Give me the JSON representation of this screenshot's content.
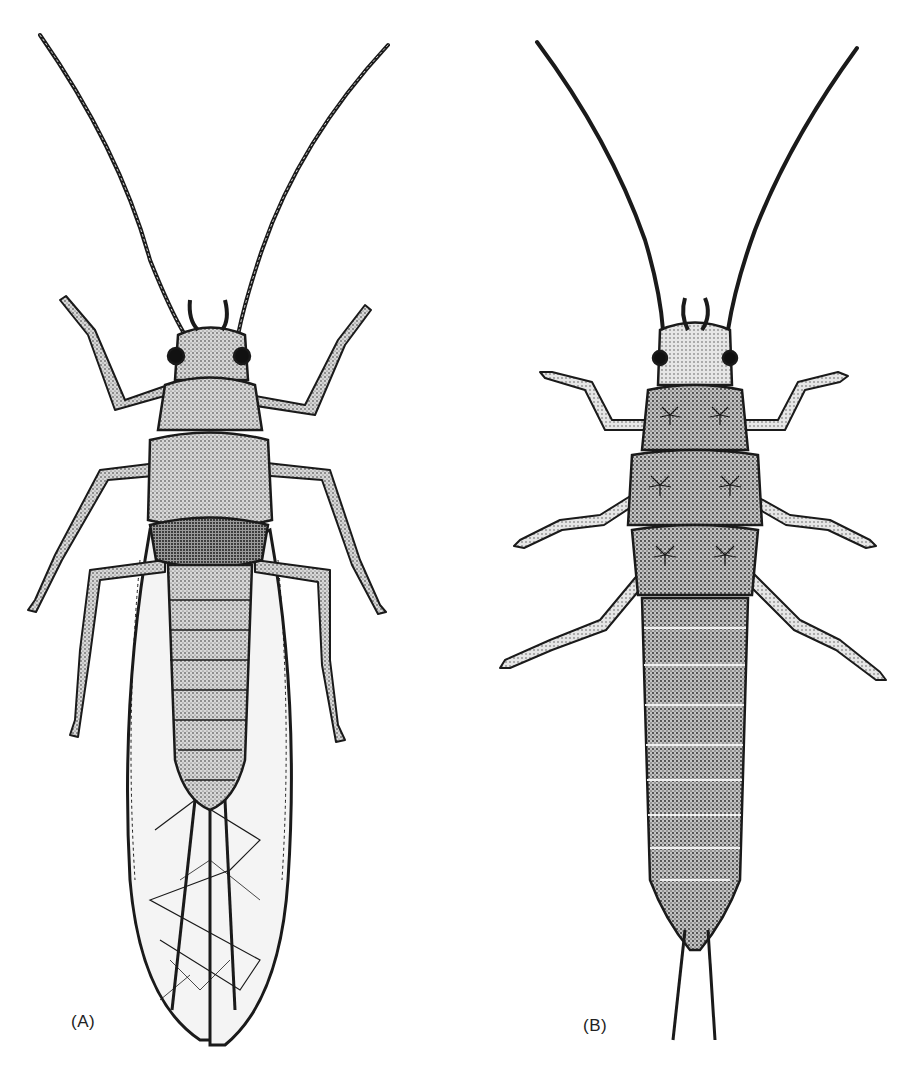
{
  "figure": {
    "caption_remnant": "",
    "panels": [
      {
        "id": "A",
        "label": "(A)",
        "subject": "adult stonefly, dorsal view, wings folded"
      },
      {
        "id": "B",
        "label": "(B)",
        "subject": "stonefly nymph, ventral view with gill tufts"
      }
    ]
  },
  "colors": {
    "ink": "#1a1a1a",
    "background": "#ffffff",
    "stipple": "#555555"
  }
}
